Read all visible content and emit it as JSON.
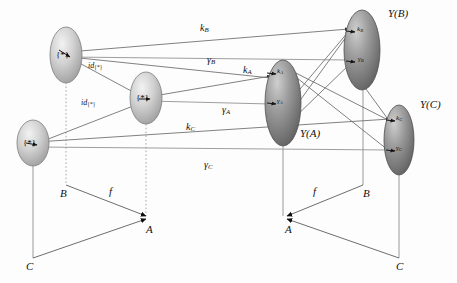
{
  "figure": {
    "type": "commutative-diagram"
  },
  "objects": {
    "source_top": {
      "label": "{*}"
    },
    "source_middle": {
      "label": "{*}"
    },
    "source_bottom": {
      "label": "{*}"
    },
    "target_a": {
      "label": "Y(A)"
    },
    "target_b": {
      "label": "Y(B)"
    },
    "target_c": {
      "label": "Y(C)"
    }
  },
  "node_points": {
    "k_a": {
      "base": "k",
      "sub": "A"
    },
    "gamma_a": {
      "base": "γ",
      "sub": "A"
    },
    "k_b": {
      "base": "k",
      "sub": "B"
    },
    "gamma_b": {
      "base": "γ",
      "sub": "B"
    },
    "k_c": {
      "base": "k",
      "sub": "C"
    },
    "gamma_c": {
      "base": "γ",
      "sub": "C"
    }
  },
  "edge_labels": {
    "k_b": {
      "base": "k",
      "sub": "B"
    },
    "gamma_b": {
      "base": "γ",
      "sub": "B"
    },
    "k_a": {
      "base": "k",
      "sub": "A"
    },
    "gamma_a": {
      "base": "γ",
      "sub": "A"
    },
    "k_c": {
      "base": "k",
      "sub": "C"
    },
    "gamma_c": {
      "base": "γ",
      "sub": "C"
    },
    "id_upper": {
      "base": "id",
      "sub": "{*}"
    },
    "id_lower": {
      "base": "id",
      "sub": "{*}"
    }
  },
  "base_left": {
    "vertex_a": "A",
    "vertex_b": "B",
    "vertex_c": "C",
    "map_f": "f"
  },
  "base_right": {
    "vertex_a": "A",
    "vertex_b": "B",
    "vertex_c": "C",
    "map_f": "f"
  },
  "colors": {
    "line": "#4a4a4a",
    "dotted_line": "#9a9a9a",
    "text": "#111111",
    "ellipse_light": "#e8e8e8",
    "ellipse_mid": "#b5b5b5",
    "ellipse_dark": "#6e6e6e",
    "background": "#fdfdfd"
  }
}
